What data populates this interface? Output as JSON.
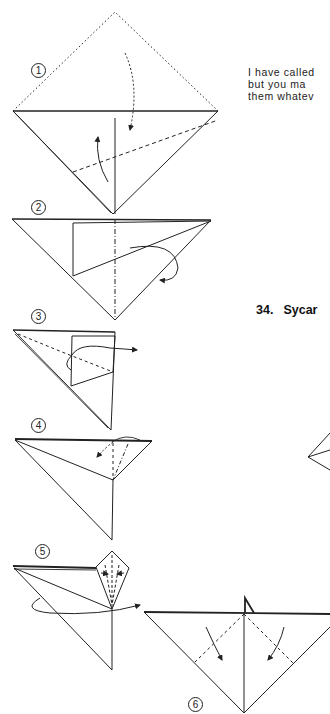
{
  "page": {
    "intro_lines": [
      "I have called",
      "but you ma",
      "them whatev"
    ],
    "section": {
      "number": "34.",
      "title": "Sycar"
    },
    "steps": [
      {
        "label": "1"
      },
      {
        "label": "2"
      },
      {
        "label": "3"
      },
      {
        "label": "4"
      },
      {
        "label": "5"
      },
      {
        "label": "6"
      }
    ]
  }
}
